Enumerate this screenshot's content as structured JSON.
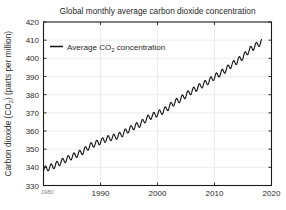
{
  "chart_data": {
    "type": "line",
    "title": "Global monthly average carbon dioxide concentration",
    "xlabel": "",
    "ylabel": "Carbon dioxide (CO2) (parts per million)",
    "ylabel_parts": {
      "pre": "Carbon dioxide (CO",
      "sub": "2",
      "post": ") (parts per million)"
    },
    "title_parts": {
      "text": "Global monthly average carbon dioxide concentration"
    },
    "xlim": [
      1980,
      2020
    ],
    "ylim": [
      330,
      420
    ],
    "xticks": [
      1980,
      1990,
      2000,
      2010,
      2020
    ],
    "xtick_labels": [
      "1980",
      "1990",
      "2000",
      "2010",
      "2020"
    ],
    "yticks": [
      330,
      340,
      350,
      360,
      370,
      380,
      390,
      400,
      410,
      420
    ],
    "ytick_labels": [
      "330",
      "340",
      "350",
      "360",
      "370",
      "380",
      "390",
      "400",
      "410",
      "420"
    ],
    "grid": true,
    "grid_color": "#d9d9d9",
    "axis_color": "#1a1a1a",
    "line_color": "#111111",
    "line_width": 1.1,
    "legend": {
      "position": "top-left-inside",
      "entries": [
        {
          "label": "Average CO2 concentration",
          "label_pre": "Average CO",
          "label_sub": "2",
          "label_post": " concentration",
          "color": "#111111"
        }
      ]
    },
    "series": [
      {
        "name": "Average CO2 concentration",
        "description": "Monthly global mean CO2, seasonal cycle superimposed on rising trend",
        "x_start": 1980.0,
        "x_end": 2018.3,
        "sampling": "monthly",
        "annual_trend_points": [
          {
            "year": 1980,
            "value": 338.8
          },
          {
            "year": 1981,
            "value": 339.9
          },
          {
            "year": 1982,
            "value": 341.1
          },
          {
            "year": 1983,
            "value": 342.8
          },
          {
            "year": 1984,
            "value": 344.4
          },
          {
            "year": 1985,
            "value": 345.9
          },
          {
            "year": 1986,
            "value": 347.2
          },
          {
            "year": 1987,
            "value": 348.9
          },
          {
            "year": 1988,
            "value": 351.5
          },
          {
            "year": 1989,
            "value": 352.9
          },
          {
            "year": 1990,
            "value": 354.2
          },
          {
            "year": 1991,
            "value": 355.6
          },
          {
            "year": 1992,
            "value": 356.4
          },
          {
            "year": 1993,
            "value": 357.1
          },
          {
            "year": 1994,
            "value": 358.8
          },
          {
            "year": 1995,
            "value": 360.8
          },
          {
            "year": 1996,
            "value": 362.6
          },
          {
            "year": 1997,
            "value": 363.8
          },
          {
            "year": 1998,
            "value": 366.6
          },
          {
            "year": 1999,
            "value": 368.3
          },
          {
            "year": 2000,
            "value": 369.5
          },
          {
            "year": 2001,
            "value": 371.0
          },
          {
            "year": 2002,
            "value": 373.2
          },
          {
            "year": 2003,
            "value": 375.8
          },
          {
            "year": 2004,
            "value": 377.5
          },
          {
            "year": 2005,
            "value": 379.8
          },
          {
            "year": 2006,
            "value": 381.9
          },
          {
            "year": 2007,
            "value": 383.8
          },
          {
            "year": 2008,
            "value": 385.6
          },
          {
            "year": 2009,
            "value": 387.4
          },
          {
            "year": 2010,
            "value": 389.8
          },
          {
            "year": 2011,
            "value": 391.6
          },
          {
            "year": 2012,
            "value": 393.8
          },
          {
            "year": 2013,
            "value": 396.5
          },
          {
            "year": 2014,
            "value": 398.6
          },
          {
            "year": 2015,
            "value": 400.8
          },
          {
            "year": 2016,
            "value": 404.2
          },
          {
            "year": 2017,
            "value": 406.5
          },
          {
            "year": 2018,
            "value": 408.5
          }
        ],
        "seasonal_amplitude_ppm": 1.6,
        "seasonal_peak_month": 5,
        "y_min_observed": 336.8,
        "y_max_observed": 409.0
      }
    ]
  }
}
